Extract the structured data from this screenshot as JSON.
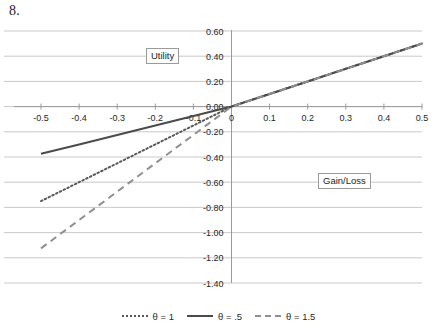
{
  "figure": {
    "number": "8.",
    "y_axis_label": "Utility",
    "x_axis_label": "Gain/Loss"
  },
  "legend": {
    "items": [
      {
        "label": "θ = 1",
        "style": "dotted",
        "color": "#595959"
      },
      {
        "label": "θ = .5",
        "style": "solid",
        "color": "#4b4b4b"
      },
      {
        "label": "θ = 1.5",
        "style": "dashed",
        "color": "#8f8f8f"
      }
    ]
  },
  "chart_data": {
    "type": "line",
    "title": "",
    "xlabel": "Gain/Loss",
    "ylabel": "Utility",
    "xlim": [
      -0.5,
      0.5
    ],
    "ylim": [
      -1.4,
      0.6
    ],
    "grid": true,
    "legend_position": "bottom",
    "x_ticks": [
      "-0.5",
      "-0.4",
      "-0.3",
      "-0.2",
      "-0.1",
      "0",
      "0.1",
      "0.2",
      "0.3",
      "0.4",
      "0.5"
    ],
    "x_tick_values": [
      -0.5,
      -0.4,
      -0.3,
      -0.2,
      -0.1,
      0,
      0.1,
      0.2,
      0.3,
      0.4,
      0.5
    ],
    "y_ticks": [
      "0.60",
      "0.40",
      "0.20",
      "0.00",
      "-0.20",
      "-0.40",
      "-0.60",
      "-0.80",
      "-1.00",
      "-1.20",
      "-1.40"
    ],
    "y_tick_values": [
      0.6,
      0.4,
      0.2,
      0.0,
      -0.2,
      -0.4,
      -0.6,
      -0.8,
      -1.0,
      -1.2,
      -1.4
    ],
    "x": [
      -0.5,
      -0.4,
      -0.3,
      -0.2,
      -0.1,
      0,
      0.1,
      0.2,
      0.3,
      0.4,
      0.5
    ],
    "series": [
      {
        "name": "θ = 1",
        "style": "dotted",
        "color": "#595959",
        "values": [
          -0.75,
          -0.6,
          -0.45,
          -0.3,
          -0.15,
          0.0,
          0.1,
          0.2,
          0.3,
          0.4,
          0.5
        ]
      },
      {
        "name": "θ = .5",
        "style": "solid",
        "color": "#4b4b4b",
        "values": [
          -0.375,
          -0.3,
          -0.225,
          -0.15,
          -0.075,
          0.0,
          0.1,
          0.2,
          0.3,
          0.4,
          0.5
        ]
      },
      {
        "name": "θ = 1.5",
        "style": "dashed",
        "color": "#8f8f8f",
        "values": [
          -1.125,
          -0.9,
          -0.675,
          -0.45,
          -0.225,
          0.0,
          0.1,
          0.2,
          0.3,
          0.4,
          0.5
        ]
      }
    ]
  },
  "style": {
    "grid_color": "#c9c9c9",
    "axis_color": "#9a9a9a",
    "text_color": "#1f1f1f",
    "background": "#ffffff"
  }
}
